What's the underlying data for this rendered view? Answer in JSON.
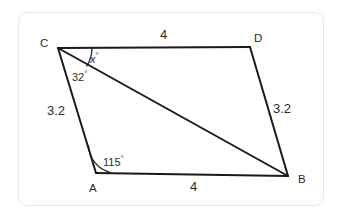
{
  "figure": {
    "kind": "parallelogram-with-diagonal",
    "stroke_color": "#1a1a1a",
    "text_color": "#2b2b2b",
    "background_color": "#ffffff",
    "frame_color": "#e8e8e8",
    "vertices": [
      {
        "id": "C",
        "label": "C",
        "x": 58,
        "y": 48
      },
      {
        "id": "D",
        "label": "D",
        "x": 250,
        "y": 47
      },
      {
        "id": "B",
        "label": "B",
        "x": 288,
        "y": 176
      },
      {
        "id": "A",
        "label": "A",
        "x": 96,
        "y": 173
      }
    ],
    "edges": [
      {
        "id": "CD",
        "from": "C",
        "to": "D"
      },
      {
        "id": "DB",
        "from": "D",
        "to": "B"
      },
      {
        "id": "BA",
        "from": "B",
        "to": "A"
      },
      {
        "id": "AC",
        "from": "A",
        "to": "C"
      },
      {
        "id": "CB",
        "from": "C",
        "to": "B",
        "role": "diagonal"
      }
    ],
    "side_labels": [
      {
        "id": "cd-length",
        "text": "4",
        "edge": "CD"
      },
      {
        "id": "ab-length",
        "text": "4",
        "edge": "BA"
      },
      {
        "id": "ac-length",
        "text": "3.2",
        "edge": "AC"
      },
      {
        "id": "db-length",
        "text": "3.2",
        "edge": "DB"
      }
    ],
    "angle_labels": [
      {
        "id": "angle-x",
        "value": "x",
        "unit": "°",
        "at_vertex": "C",
        "between": [
          "CD",
          "CB"
        ]
      },
      {
        "id": "angle-32",
        "value": "32",
        "unit": "°",
        "at_vertex": "C",
        "between": [
          "CB",
          "CA"
        ]
      },
      {
        "id": "angle-115",
        "value": "115",
        "unit": "°",
        "at_vertex": "A",
        "between": [
          "AC",
          "AB"
        ]
      }
    ]
  }
}
